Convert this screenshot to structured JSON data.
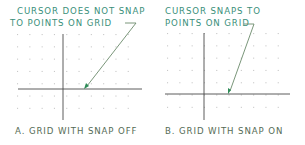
{
  "panels": [
    {
      "id": "A",
      "callout_lines": [
        "CURSOR DOES NOT SNAP",
        "TO POINTS ON GRID"
      ],
      "caption": "A. GRID WITH SNAP OFF",
      "snap": false
    },
    {
      "id": "B",
      "callout_lines": [
        "CURSOR SNAPS TO",
        "POINTS ON GRID"
      ],
      "caption": "B. GRID WITH SNAP ON",
      "snap": true
    }
  ],
  "colors": {
    "callout_text": "#3a8f7a",
    "caption_text": "#556b55",
    "axis_line": "#4a4a4a",
    "grid_dot": "#c8c8c8",
    "leader": "#6b8a6b",
    "arrow": "#2e8b57"
  }
}
